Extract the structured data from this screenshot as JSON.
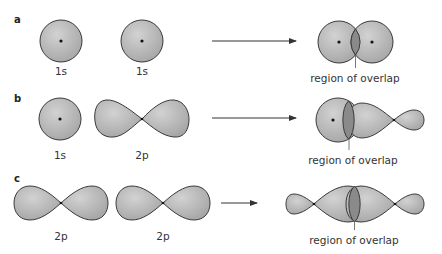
{
  "figure": {
    "colors": {
      "orbital_fill": "#b8b8b8",
      "overlap_fill": "#8a8a8a",
      "outline": "#3a3a3a",
      "arrow": "#333333"
    },
    "panels": [
      {
        "label": "a",
        "left_orbital": "1s",
        "right_orbital": "1s",
        "result_label": "region of overlap"
      },
      {
        "label": "b",
        "left_orbital": "1s",
        "right_orbital": "2p",
        "result_label": "region of overlap"
      },
      {
        "label": "c",
        "left_orbital": "2p",
        "right_orbital": "2p",
        "result_label": "region of overlap"
      }
    ]
  }
}
